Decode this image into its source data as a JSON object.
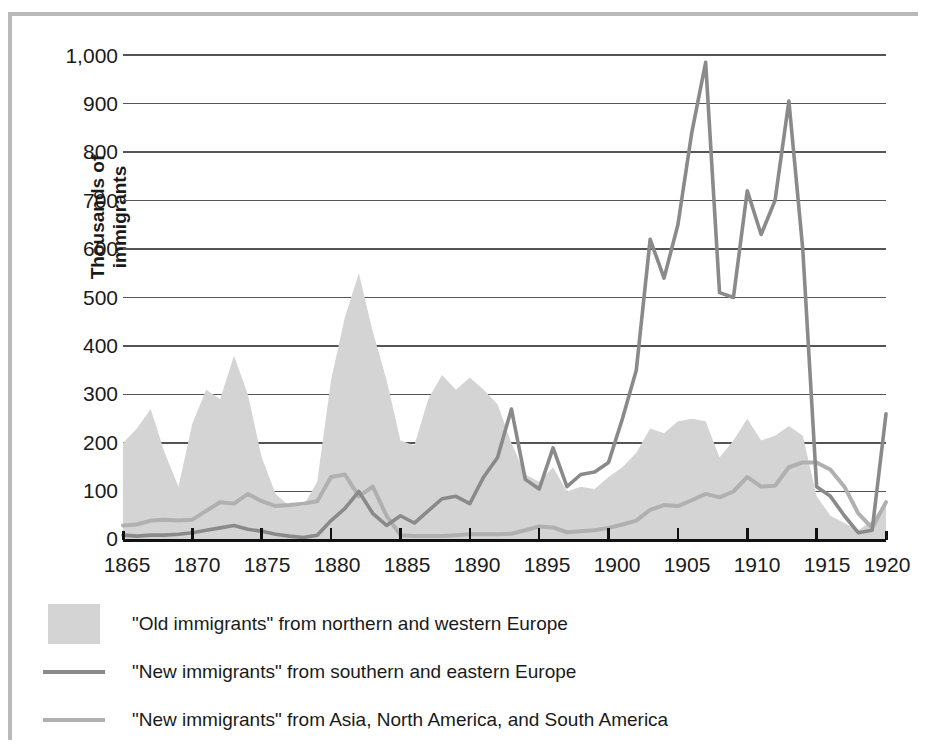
{
  "figure": {
    "border_color": "#b9b9b9",
    "background": "#ffffff"
  },
  "axis": {
    "ylabel": "Thousands of immigrants",
    "yticks": [
      "0",
      "100",
      "200",
      "300",
      "400",
      "500",
      "600",
      "700",
      "800",
      "900",
      "1,000"
    ],
    "xticks": [
      "1865",
      "1870",
      "1875",
      "1880",
      "1885",
      "1890",
      "1895",
      "1900",
      "1905",
      "1910",
      "1915",
      "1920"
    ]
  },
  "legend": {
    "items": [
      {
        "marker": "filled-swatch",
        "color": "#d4d4d4",
        "label": "\"Old immigrants\" from northern and western Europe"
      },
      {
        "marker": "line",
        "color": "#8a8a8a",
        "label": "\"New immigrants\" from southern and eastern Europe"
      },
      {
        "marker": "line",
        "color": "#b0b0b0",
        "label": "\"New immigrants\" from Asia, North America, and South America"
      }
    ]
  },
  "chart_data": {
    "type": "area",
    "title": "",
    "xlabel": "",
    "ylabel": "Thousands of immigrants",
    "xlim": [
      1865,
      1920
    ],
    "ylim": [
      0,
      1000
    ],
    "grid": true,
    "legend_position": "bottom-left",
    "colors": {
      "old_immigrants_fill": "#d4d4d4",
      "new_immigrants_europe_line": "#8a8a8a",
      "new_immigrants_other_line": "#b0b0b0",
      "gridline": "#555555",
      "axis": "#111111"
    },
    "x": [
      1865,
      1866,
      1867,
      1868,
      1869,
      1870,
      1871,
      1872,
      1873,
      1874,
      1875,
      1876,
      1877,
      1878,
      1879,
      1880,
      1881,
      1882,
      1883,
      1884,
      1885,
      1886,
      1887,
      1888,
      1889,
      1890,
      1891,
      1892,
      1893,
      1894,
      1895,
      1896,
      1897,
      1898,
      1899,
      1900,
      1901,
      1902,
      1903,
      1904,
      1905,
      1906,
      1907,
      1908,
      1909,
      1910,
      1911,
      1912,
      1913,
      1914,
      1915,
      1916,
      1917,
      1918,
      1919,
      1920
    ],
    "series": [
      {
        "name": "\"Old immigrants\" from northern and western Europe",
        "type": "area",
        "color": "#d4d4d4",
        "values": [
          200,
          230,
          270,
          180,
          110,
          240,
          310,
          290,
          380,
          300,
          170,
          95,
          70,
          70,
          120,
          330,
          460,
          550,
          430,
          330,
          205,
          195,
          290,
          340,
          310,
          335,
          310,
          280,
          200,
          135,
          120,
          150,
          100,
          110,
          105,
          130,
          150,
          180,
          230,
          220,
          245,
          250,
          245,
          170,
          205,
          250,
          205,
          215,
          235,
          215,
          90,
          50,
          35,
          20,
          40,
          80
        ],
        "note": "Shaded area series, plotted from 0 baseline"
      },
      {
        "name": "\"New immigrants\" from southern and eastern Europe",
        "type": "line",
        "color": "#8a8a8a",
        "values": [
          10,
          8,
          10,
          10,
          12,
          15,
          20,
          25,
          30,
          22,
          18,
          12,
          8,
          5,
          10,
          40,
          65,
          100,
          55,
          30,
          50,
          35,
          60,
          85,
          90,
          75,
          130,
          170,
          270,
          125,
          105,
          190,
          110,
          135,
          140,
          160,
          250,
          350,
          620,
          540,
          650,
          840,
          985,
          510,
          500,
          720,
          630,
          700,
          905,
          600,
          110,
          90,
          50,
          15,
          20,
          260
        ]
      },
      {
        "name": "\"New immigrants\" from Asia, North America, and South America",
        "type": "line",
        "color": "#b0b0b0",
        "values": [
          30,
          32,
          40,
          42,
          40,
          42,
          60,
          78,
          75,
          95,
          80,
          70,
          72,
          75,
          80,
          130,
          135,
          90,
          110,
          50,
          10,
          8,
          8,
          8,
          10,
          12,
          12,
          12,
          13,
          20,
          28,
          26,
          16,
          18,
          20,
          25,
          32,
          40,
          62,
          72,
          70,
          82,
          95,
          88,
          100,
          130,
          110,
          112,
          150,
          160,
          160,
          145,
          110,
          55,
          25,
          78
        ]
      }
    ]
  }
}
